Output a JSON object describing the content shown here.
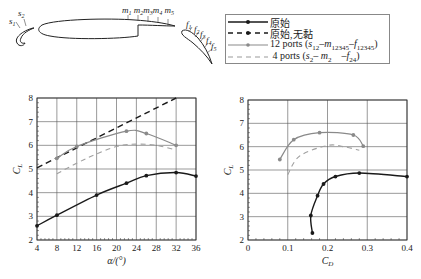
{
  "diagram": {
    "labels": {
      "s1": "s",
      "s1_sub": "1",
      "s2": "s",
      "s2_sub": "2",
      "m": [
        "m1",
        "m2",
        "m3",
        "m4",
        "m5"
      ],
      "f": [
        "f1",
        "f2",
        "f3",
        "f4",
        "f5"
      ]
    }
  },
  "legend": {
    "items": [
      {
        "label": "原始",
        "style": "solid",
        "color": "#1a1a1a",
        "marker": true
      },
      {
        "label": "原始,无黏",
        "style": "dashed",
        "color": "#1a1a1a",
        "marker": true
      },
      {
        "label": "12 ports (s12–m12345–f12345)",
        "style": "solid",
        "color": "#8a8a8a",
        "marker": true
      },
      {
        "label": "4 ports (s2– m2    –f24)",
        "style": "dashed",
        "color": "#9a9a9a",
        "marker": false
      }
    ]
  },
  "chart_data": [
    {
      "type": "line",
      "title": "",
      "xlabel": "α/(°)",
      "ylabel": "CL",
      "xlim": [
        4,
        36
      ],
      "ylim": [
        2,
        8
      ],
      "xticks": [
        4,
        8,
        12,
        16,
        20,
        24,
        28,
        32,
        36
      ],
      "yticks": [
        2,
        3,
        4,
        5,
        6,
        7,
        8
      ],
      "grid": true,
      "series": [
        {
          "name": "原始",
          "x": [
            4,
            8,
            16,
            22,
            26,
            32,
            36
          ],
          "y": [
            2.6,
            3.05,
            3.9,
            4.4,
            4.72,
            4.85,
            4.7
          ]
        },
        {
          "name": "原始,无黏",
          "x": [
            4,
            32
          ],
          "y": [
            5.05,
            8.0
          ]
        },
        {
          "name": "12 ports (s12–m12345–f12345)",
          "x": [
            8,
            12,
            22,
            26,
            32
          ],
          "y": [
            5.45,
            5.95,
            6.6,
            6.5,
            6.0
          ]
        },
        {
          "name": "4 ports (s2–m2–f24)",
          "x": [
            8,
            14,
            20,
            24,
            28,
            32
          ],
          "y": [
            4.8,
            5.45,
            5.95,
            6.05,
            6.0,
            5.8
          ]
        }
      ]
    },
    {
      "type": "line",
      "title": "",
      "xlabel": "CD",
      "ylabel": "CL",
      "xlim": [
        0,
        0.4
      ],
      "ylim": [
        2,
        8
      ],
      "xticks": [
        0,
        0.1,
        0.2,
        0.3,
        0.4
      ],
      "yticks": [
        2,
        3,
        4,
        5,
        6,
        7,
        8
      ],
      "grid": true,
      "series": [
        {
          "name": "原始",
          "x": [
            0.162,
            0.158,
            0.175,
            0.19,
            0.22,
            0.28,
            0.4
          ],
          "y": [
            2.3,
            3.05,
            3.9,
            4.4,
            4.72,
            4.87,
            4.72
          ]
        },
        {
          "name": "12 ports (s12–m12345–f12345)",
          "x": [
            0.08,
            0.115,
            0.18,
            0.265,
            0.29
          ],
          "y": [
            5.45,
            6.3,
            6.6,
            6.5,
            6.02
          ]
        },
        {
          "name": "4 ports (s2–m2–f24)",
          "x": [
            0.1,
            0.13,
            0.2,
            0.24,
            0.28
          ],
          "y": [
            4.8,
            5.6,
            6.05,
            6.0,
            5.85
          ]
        }
      ]
    }
  ]
}
